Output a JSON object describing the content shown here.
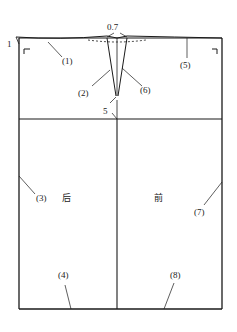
{
  "diagram": {
    "type": "skirt-pattern-draft",
    "labels": {
      "dart_width": "0.7",
      "waist_raise": "1",
      "dart_depth": "5",
      "l1": "(1)",
      "l2": "(2)",
      "l3": "(3)",
      "l4": "(4)",
      "l5": "(5)",
      "l6": "(6)",
      "l7": "(7)",
      "l8": "(8)",
      "back": "后",
      "front": "前"
    },
    "colors": {
      "line": "#1a1a1a",
      "background": "#ffffff"
    }
  }
}
